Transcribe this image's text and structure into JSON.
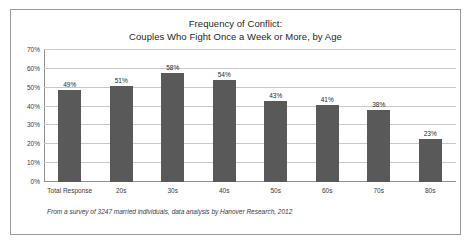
{
  "figure": {
    "footnote": "From a survey of 3247 married individuals, data analysis by Hanover Research, 2012",
    "border_color": "#9a9a9a",
    "background_color": "#ffffff"
  },
  "chart_data": {
    "type": "bar",
    "title": "Frequency of Conflict:  Couples Who Fight Once a Week or More, by Age",
    "title_line1": "Frequency of Conflict:",
    "title_line2": "Couples Who Fight Once a Week or More, by Age",
    "xlabel": "",
    "ylabel": "",
    "categories": [
      "Total Response",
      "20s",
      "30s",
      "40s",
      "50s",
      "60s",
      "70s",
      "80s"
    ],
    "values": [
      49,
      51,
      58,
      54,
      43,
      41,
      38,
      23
    ],
    "value_labels": [
      "49%",
      "51%",
      "58%",
      "54%",
      "43%",
      "41%",
      "38%",
      "23%"
    ],
    "ylim": [
      0,
      70
    ],
    "ytick_values": [
      0,
      10,
      20,
      30,
      40,
      50,
      60,
      70
    ],
    "ytick_labels": [
      "0%",
      "10%",
      "20%",
      "30%",
      "40%",
      "50%",
      "60%",
      "70%"
    ],
    "grid": true,
    "grid_axis": "y",
    "legend": false,
    "bar_color": "#595959",
    "gridline_color": "#c8c8c8",
    "axis_color": "#8f8f8f"
  }
}
